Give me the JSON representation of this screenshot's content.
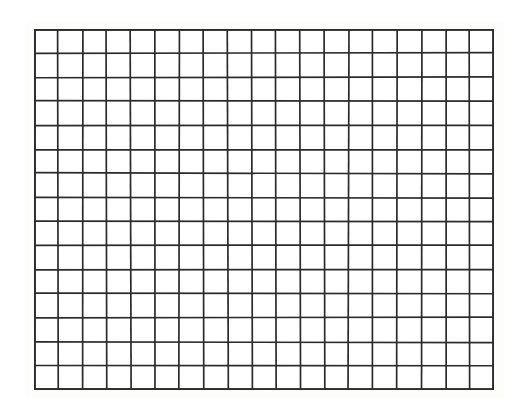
{
  "page": {
    "width": 528,
    "height": 409,
    "background_color": "#ffffff",
    "paper_tint_color": "#fdfdfc"
  },
  "grid": {
    "label": "blank-grid",
    "columns": 19,
    "rows": 15,
    "total_cells": 285,
    "cell_width": 24.2,
    "cell_height": 24.1,
    "origin_x": 34,
    "origin_y": 29,
    "width": 460,
    "height": 361,
    "line_color": "#2b2b2b",
    "line_width": 1.7,
    "border_width": 2.0,
    "cell_fill_color": "#ffffff",
    "cell_contents": []
  },
  "chart_data": {
    "type": "table",
    "title": "",
    "xlabel": "",
    "ylabel": "",
    "columns": 19,
    "rows": 15,
    "column_headers": [],
    "values": []
  }
}
